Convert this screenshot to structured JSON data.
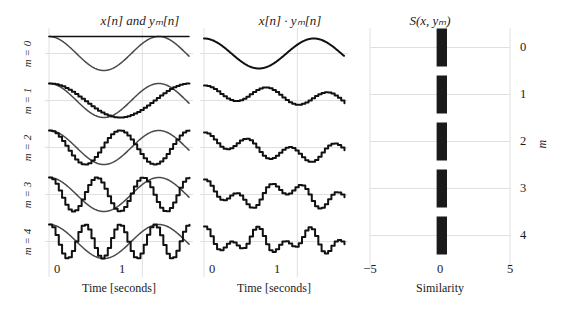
{
  "figure": {
    "width": 566,
    "height": 312,
    "background": "#ffffff",
    "ink": "#1b1b1b",
    "grid_color": "#e0e0e0",
    "signal_color": "#111111",
    "reference_color": "#4a4a4a",
    "bar_color": "#1a1a1a"
  },
  "panels": {
    "left": {
      "title": "x[n] and yₘ[n]",
      "xlabel": "Time [seconds]"
    },
    "middle": {
      "title": "x[n] · yₘ[n]",
      "xlabel": "Time [seconds]"
    },
    "right": {
      "title": "S(x, yₘ)",
      "xlabel": "Similarity",
      "ylabel": "m"
    }
  },
  "row_labels": [
    "m = 0",
    "m = 1",
    "m = 2",
    "m = 3",
    "m = 4"
  ],
  "time_ticks": [
    "0",
    "1"
  ],
  "similarity_ticks": [
    "−5",
    "0",
    "5"
  ],
  "m_ticks": [
    "0",
    "1",
    "2",
    "3",
    "4"
  ],
  "chart_data": {
    "type": "line",
    "panels": [
      {
        "name": "signals",
        "type": "line",
        "title": "x[n] and yₘ[n]",
        "xlabel": "Time [seconds]",
        "ylabel": "",
        "xlim": [
          0,
          1.5
        ],
        "xticks": [
          0,
          1
        ],
        "xticklabels": [
          "0",
          "1"
        ],
        "grid": true,
        "rows": [
          {
            "m": 0,
            "label": "m = 0",
            "series": [
              {
                "name": "x[n]",
                "kind": "sine",
                "frequency_hz": 0.85,
                "amplitude": 1.0,
                "phase": 0.0,
                "quantized": false,
                "color": "#4a4a4a"
              },
              {
                "name": "y₀[n]",
                "kind": "constant",
                "frequency_hz": 0.0,
                "amplitude": 1.0,
                "phase": 0.0,
                "quantized": false,
                "color": "#111111"
              }
            ]
          },
          {
            "m": 1,
            "label": "m = 1",
            "series": [
              {
                "name": "x[n]",
                "kind": "sine",
                "frequency_hz": 0.85,
                "amplitude": 1.0,
                "phase": 0.0,
                "quantized": false,
                "color": "#4a4a4a"
              },
              {
                "name": "y₁[n]",
                "kind": "sine",
                "frequency_hz": 0.67,
                "amplitude": 1.0,
                "phase": 0.0,
                "quantized": true,
                "color": "#111111"
              }
            ]
          },
          {
            "m": 2,
            "label": "m = 2",
            "series": [
              {
                "name": "x[n]",
                "kind": "sine",
                "frequency_hz": 0.85,
                "amplitude": 1.0,
                "phase": 0.0,
                "quantized": false,
                "color": "#4a4a4a"
              },
              {
                "name": "y₂[n]",
                "kind": "sine",
                "frequency_hz": 1.34,
                "amplitude": 1.0,
                "phase": 0.0,
                "quantized": true,
                "color": "#111111"
              }
            ]
          },
          {
            "m": 3,
            "label": "m = 3",
            "series": [
              {
                "name": "x[n]",
                "kind": "sine",
                "frequency_hz": 0.85,
                "amplitude": 1.0,
                "phase": 0.0,
                "quantized": false,
                "color": "#4a4a4a"
              },
              {
                "name": "y₃[n]",
                "kind": "sine",
                "frequency_hz": 2.01,
                "amplitude": 1.0,
                "phase": 0.0,
                "quantized": true,
                "color": "#111111"
              }
            ]
          },
          {
            "m": 4,
            "label": "m = 4",
            "series": [
              {
                "name": "x[n]",
                "kind": "sine",
                "frequency_hz": 0.85,
                "amplitude": 1.0,
                "phase": 0.0,
                "quantized": false,
                "color": "#4a4a4a"
              },
              {
                "name": "y₄[n]",
                "kind": "sine",
                "frequency_hz": 2.68,
                "amplitude": 1.0,
                "phase": 0.0,
                "quantized": true,
                "color": "#111111"
              }
            ]
          }
        ]
      },
      {
        "name": "products",
        "type": "line",
        "title": "x[n] · yₘ[n]",
        "xlabel": "Time [seconds]",
        "ylabel": "",
        "xlim": [
          0,
          1.5
        ],
        "xticks": [
          0,
          1
        ],
        "xticklabels": [
          "0",
          "1"
        ],
        "grid": true,
        "rows": [
          {
            "m": 0,
            "label": "m = 0",
            "product_of": [
              "x[n]",
              "y₀[n]"
            ],
            "color": "#111111"
          },
          {
            "m": 1,
            "label": "m = 1",
            "product_of": [
              "x[n]",
              "y₁[n]"
            ],
            "color": "#111111"
          },
          {
            "m": 2,
            "label": "m = 2",
            "product_of": [
              "x[n]",
              "y₂[n]"
            ],
            "color": "#111111"
          },
          {
            "m": 3,
            "label": "m = 3",
            "product_of": [
              "x[n]",
              "y₃[n]"
            ],
            "color": "#111111"
          },
          {
            "m": 4,
            "label": "m = 4",
            "product_of": [
              "x[n]",
              "y₄[n]"
            ],
            "color": "#111111"
          }
        ]
      },
      {
        "name": "similarity",
        "type": "bar",
        "orientation": "horizontal",
        "title": "S(x, yₘ)",
        "xlabel": "Similarity",
        "ylabel": "m",
        "xlim": [
          -6.2,
          6.2
        ],
        "xticks": [
          -5,
          0,
          5
        ],
        "xticklabels": [
          "−5",
          "0",
          "5"
        ],
        "categories": [
          "0",
          "1",
          "2",
          "3",
          "4"
        ],
        "values": [
          0.62,
          0.62,
          0.62,
          0.62,
          0.62
        ],
        "value_left_extent": [
          -0.3,
          -0.3,
          -0.3,
          -0.3,
          -0.3
        ],
        "grid": true,
        "bar_color": "#1a1a1a"
      }
    ]
  }
}
